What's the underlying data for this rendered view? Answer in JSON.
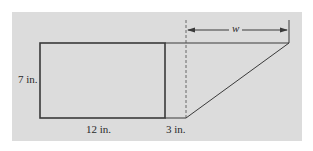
{
  "figure": {
    "background_color": "#dcdcdc",
    "line_color": "#3a3a3a",
    "labels": {
      "height": "7 in.",
      "rect_width": "12 in.",
      "offset": "3 in.",
      "unknown_width": "w"
    },
    "shapes": {
      "rectangle": {
        "width_in": 12,
        "height_in": 7
      },
      "gap_in": 3,
      "triangle": {
        "height_in": 7,
        "base_label": "w"
      }
    }
  }
}
